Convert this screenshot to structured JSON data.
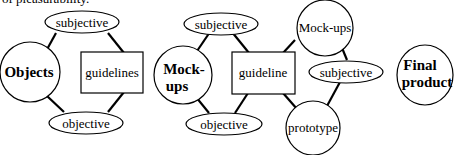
{
  "caption": "of pleasurability.",
  "diagram": {
    "left_group": {
      "nodes": {
        "subjective": "subjective",
        "objects": "Objects",
        "guidelines": "guidelines",
        "objective": "objective"
      }
    },
    "middle_group": {
      "nodes": {
        "subjective": "subjective",
        "mockups_line1": "Mock-",
        "mockups_line2": "ups",
        "guideline": "guideline",
        "objective": "objective",
        "mockups_right": "Mock-ups",
        "subjective_right": "subjective",
        "prototype": "prototype"
      }
    },
    "right_group": {
      "nodes": {
        "final_line1": "Final",
        "final_line2": "product"
      }
    },
    "colors": {
      "stroke": "#000000",
      "background": "#ffffff"
    }
  }
}
